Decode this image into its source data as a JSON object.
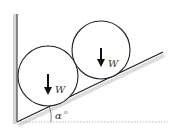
{
  "diagram": {
    "type": "physics-free-body",
    "colors": {
      "line": "#222222",
      "shadow": "#c8c8c8",
      "dotted": "#aaaaaa",
      "background": "#ffffff"
    },
    "wall": {
      "x": 17,
      "y_top": 14,
      "y_bottom": 122
    },
    "incline": {
      "x1": 17,
      "y1": 122,
      "x2": 163,
      "y2": 52
    },
    "baseline": {
      "x1": 17,
      "y1": 122,
      "x2": 168,
      "y2": 122,
      "style": "dotted"
    },
    "cylinders": [
      {
        "id": "left",
        "cx": 48,
        "cy": 76,
        "r": 30,
        "weight_label": "W"
      },
      {
        "id": "right",
        "cx": 101,
        "cy": 50,
        "r": 29,
        "weight_label": "W"
      }
    ],
    "angle": {
      "symbol": "α",
      "superscript": "o"
    }
  }
}
